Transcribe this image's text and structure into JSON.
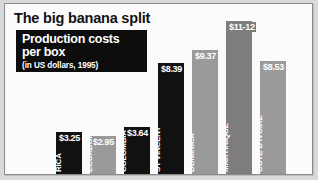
{
  "headline": "The big banana split",
  "caption": {
    "line1": "Production costs",
    "line2": "per box",
    "sub": "(in US dollars, 1995)"
  },
  "colors": {
    "bar_black": "#111111",
    "bar_gray": "#9a9a9a",
    "bar_dark": "#7d7d7d",
    "panel_bg": "#fbfbfb",
    "page_bg": "#d9d9d9",
    "caption_bg": "#0d0d0d",
    "caption_text": "#ffffff"
  },
  "chart_data": {
    "type": "bar",
    "title": "The big banana split",
    "subtitle": "Production costs per box (in US dollars, 1995)",
    "xlabel": "",
    "ylabel": "US dollars per box",
    "ylim": [
      0,
      12
    ],
    "grid": false,
    "legend": "none",
    "categories": [
      "COSTA RICA",
      "ECUADOR",
      "COLOMBIA",
      "ST VINCENT",
      "DOMINICA",
      "MARTINIQUE",
      "CÔTE D'IVOIRE"
    ],
    "values": [
      3.25,
      2.95,
      3.64,
      8.39,
      9.37,
      11.5,
      8.53
    ],
    "value_labels": [
      "$3.25",
      "$2.95",
      "$3.64",
      "$8.39",
      "$9.37",
      "$11-12",
      "$8.53"
    ],
    "bar_colors": [
      "#111111",
      "#9a9a9a",
      "#111111",
      "#111111",
      "#9a9a9a",
      "#7d7d7d",
      "#9a9a9a"
    ]
  },
  "bars": [
    {
      "label_line1": "COSTA",
      "label_line2": "RICA",
      "value_label": "$3.25",
      "style": "bar-black",
      "left": 51,
      "width": 26,
      "height": 44,
      "label_rot_left": 7
    },
    {
      "label_line1": "ECUADOR",
      "label_line2": "",
      "value_label": "$2.95",
      "style": "bar-gray",
      "left": 85,
      "width": 26,
      "height": 40,
      "label_rot_left": 4
    },
    {
      "label_line1": "COLOMBIA",
      "label_line2": "",
      "value_label": "$3.64",
      "style": "bar-black",
      "left": 119,
      "width": 26,
      "height": 49,
      "label_rot_left": 4
    },
    {
      "label_line1": "ST VINCENT",
      "label_line2": "",
      "value_label": "$8.39",
      "style": "bar-black",
      "left": 153,
      "width": 26,
      "height": 113,
      "label_rot_left": 4
    },
    {
      "label_line1": "DOMINICA",
      "label_line2": "",
      "value_label": "$9.37",
      "style": "bar-gray",
      "left": 187,
      "width": 26,
      "height": 126,
      "label_rot_left": 4
    },
    {
      "label_line1": "MARTINIQUE",
      "label_line2": "",
      "value_label": "$11-12",
      "style": "bar-dark",
      "left": 221,
      "width": 26,
      "height": 155,
      "label_rot_left": 4
    },
    {
      "label_line1": "CÔTE D'IVOIRE",
      "label_line2": "",
      "value_label": "$8.53",
      "style": "bar-gray",
      "left": 255,
      "width": 26,
      "height": 115,
      "label_rot_left": 4
    }
  ]
}
